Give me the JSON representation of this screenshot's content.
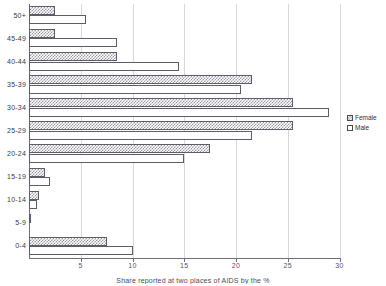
{
  "chart_data": {
    "type": "bar",
    "orientation": "horizontal",
    "title": "",
    "xlabel": "Share reported at two places of AIDS by the %",
    "ylabel": "",
    "categories": [
      "50+",
      "45-49",
      "40-44",
      "35-39",
      "30-34",
      "25-29",
      "20-24",
      "15-19",
      "10-14",
      "5-9",
      "0-4"
    ],
    "series": [
      {
        "name": "Female",
        "values": [
          2.5,
          2.5,
          8.5,
          21.5,
          25.5,
          25.5,
          17.5,
          1.5,
          1.0,
          0.2,
          7.5
        ]
      },
      {
        "name": "Male",
        "values": [
          5.5,
          8.5,
          14.5,
          20.5,
          29.0,
          21.5,
          15.0,
          2.0,
          0.8,
          0.0,
          10.0
        ]
      }
    ],
    "xlim": [
      0,
      30
    ],
    "xticks": [
      5,
      10,
      15,
      20,
      25,
      30
    ],
    "xtick_labels": [
      "5",
      "10",
      "15",
      "20",
      "25",
      "30"
    ],
    "grid": true,
    "legend_position": "right"
  },
  "legend": {
    "items": [
      {
        "label": "Female",
        "pattern": "hatched"
      },
      {
        "label": "Male",
        "pattern": "empty"
      }
    ]
  },
  "axis": {
    "x_title": "Share reported at two places of AIDS by the %"
  }
}
